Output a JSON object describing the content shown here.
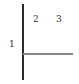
{
  "diagram": {
    "type": "partition-lines",
    "lines": [
      {
        "name": "vertical-divider",
        "orientation": "vertical",
        "color": "#2a2a2a"
      },
      {
        "name": "horizontal-divider",
        "orientation": "horizontal",
        "color": "#8a8a8a"
      }
    ],
    "labels": [
      {
        "id": "region-1",
        "text": "1"
      },
      {
        "id": "region-2",
        "text": "2"
      },
      {
        "id": "region-3",
        "text": "3"
      }
    ]
  }
}
